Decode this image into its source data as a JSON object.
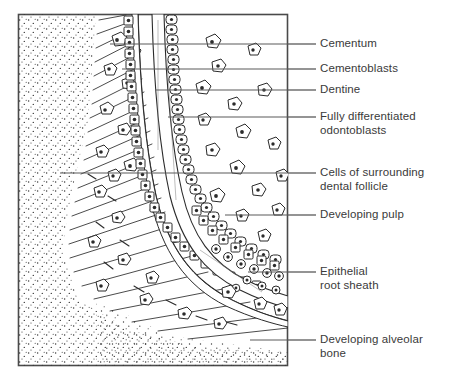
{
  "figure": {
    "kind": "histology-diagram",
    "frame": {
      "x": 18,
      "y": 14,
      "width": 270,
      "height": 352,
      "stroke": "#4a4a4a"
    },
    "ink_color": "#2b2b2b",
    "text_color": "#3a3a3a",
    "background": "#ffffff"
  },
  "regions": [
    {
      "id": "alveolar-bone",
      "name": "Developing alveolar bone",
      "fill_pattern": "stipple"
    },
    {
      "id": "dental-follicle",
      "name": "Cells of surrounding dental follicle",
      "fill_pattern": "diagonal-hatch"
    },
    {
      "id": "cementum",
      "name": "Cementum",
      "fill_pattern": "narrow-band"
    },
    {
      "id": "cementoblasts",
      "name": "Cementoblasts",
      "fill_pattern": "cell-column"
    },
    {
      "id": "dentine",
      "name": "Dentine",
      "fill_pattern": "clear-band"
    },
    {
      "id": "odontoblasts",
      "name": "Fully differentiated odontoblasts",
      "fill_pattern": "columnar-palisade"
    },
    {
      "id": "pulp",
      "name": "Developing pulp",
      "fill_pattern": "scattered-cells"
    },
    {
      "id": "root-sheath",
      "name": "Epithelial root sheath",
      "fill_pattern": "cell-cluster"
    }
  ],
  "labels": [
    {
      "id": "cementum",
      "text": "Cementum",
      "line2": "",
      "y": 44,
      "leader_x1": 288,
      "leader_x2": 316,
      "text_x": 320,
      "text_y": 37
    },
    {
      "id": "cementoblasts",
      "text": "Cementoblasts",
      "line2": "",
      "y": 69,
      "leader_x1": 288,
      "leader_x2": 316,
      "text_x": 320,
      "text_y": 62
    },
    {
      "id": "dentine",
      "text": "Dentine",
      "line2": "",
      "y": 90,
      "leader_x1": 288,
      "leader_x2": 316,
      "text_x": 320,
      "text_y": 83
    },
    {
      "id": "odontoblasts",
      "text": "Fully differentiated",
      "line2": "odontoblasts",
      "y": 117,
      "leader_x1": 288,
      "leader_x2": 316,
      "text_x": 320,
      "text_y": 110
    },
    {
      "id": "dental-follicle",
      "text": "Cells of surrounding",
      "line2": "dental follicle",
      "y": 173,
      "leader_x1": 288,
      "leader_x2": 316,
      "text_x": 320,
      "text_y": 166
    },
    {
      "id": "pulp",
      "text": "Developing pulp",
      "line2": "",
      "y": 215,
      "leader_x1": 288,
      "leader_x2": 316,
      "text_x": 320,
      "text_y": 208
    },
    {
      "id": "root-sheath",
      "text": "Epithelial",
      "line2": "root sheath",
      "y": 272,
      "leader_x1": 288,
      "leader_x2": 316,
      "text_x": 320,
      "text_y": 265
    },
    {
      "id": "alveolar-bone",
      "text": "Developing alveolar",
      "line2": "bone",
      "y": 340,
      "leader_x1": 288,
      "leader_x2": 316,
      "text_x": 320,
      "text_y": 333
    }
  ],
  "internal_leaders": [
    {
      "id": "cementum",
      "x1": 110,
      "y": 44
    },
    {
      "id": "cementoblasts",
      "x1": 122,
      "y": 69
    },
    {
      "id": "dentine",
      "x1": 155,
      "y": 90
    },
    {
      "id": "odontoblasts",
      "x1": 168,
      "y": 117
    },
    {
      "id": "dental-follicle",
      "x1": 60,
      "y": 173
    },
    {
      "id": "pulp",
      "x1": 225,
      "y": 215
    },
    {
      "id": "root-sheath",
      "x1": 248,
      "y": 272
    },
    {
      "id": "alveolar-bone",
      "x1": 250,
      "y": 340
    }
  ]
}
